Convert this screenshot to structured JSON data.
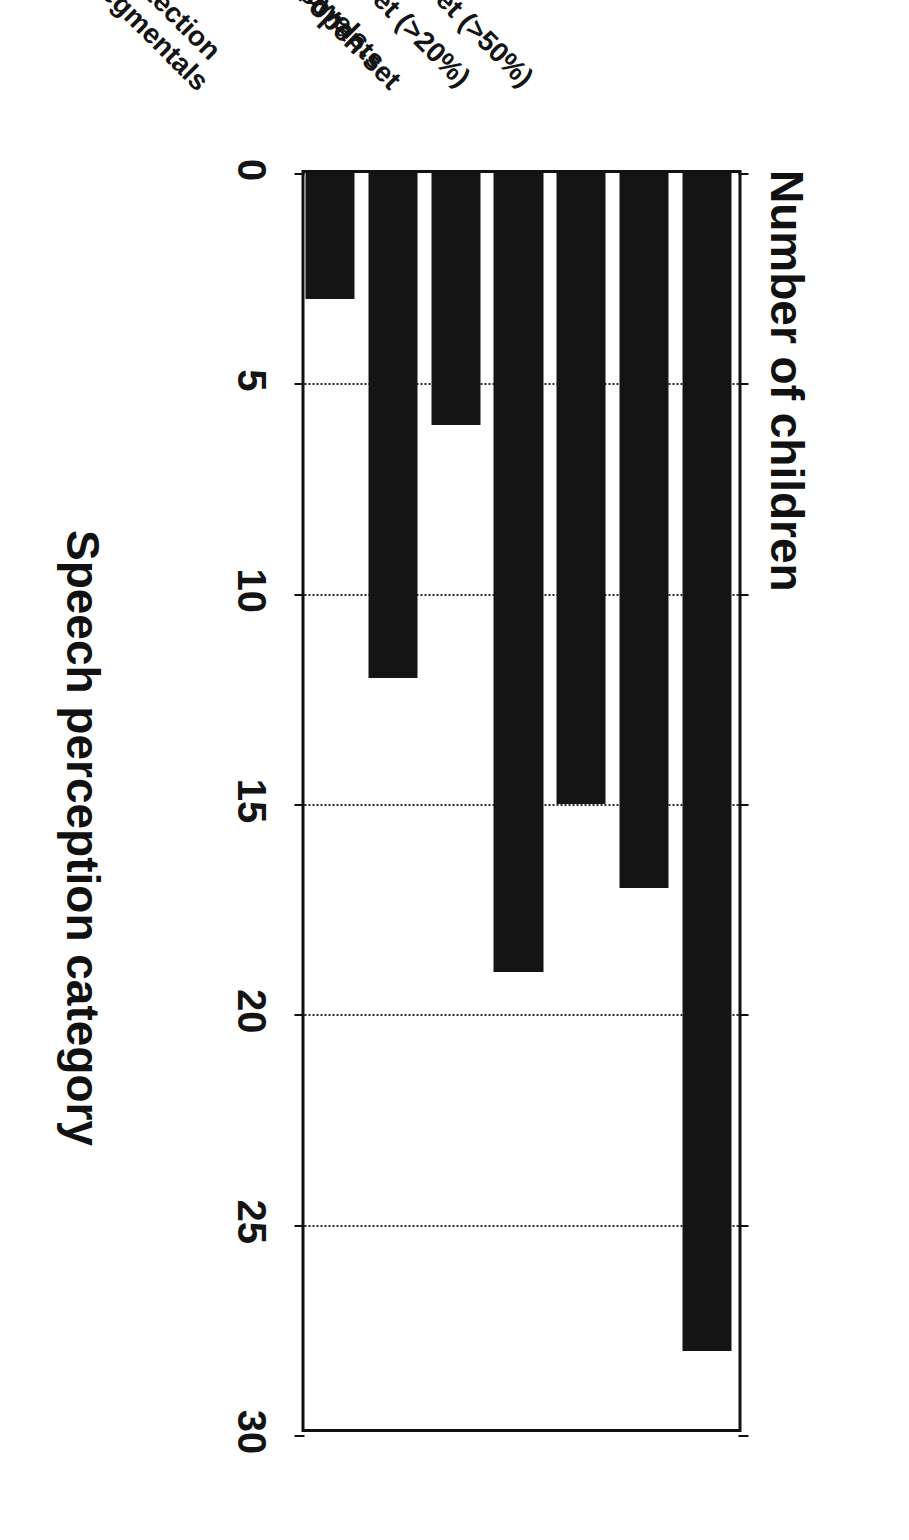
{
  "figure": {
    "orientation": "page-rotated-90-clockwise",
    "background_color": "#ffffff",
    "bar_color": "#141414",
    "axis_color": "#111111",
    "gridline_color": "#2b2b2b"
  },
  "chart_data": {
    "type": "bar",
    "title": "",
    "orientation": "vertical",
    "xlabel": "Speech perception category",
    "ylabel": "Number of children",
    "categories": [
      "1. Detection",
      "2. Suprasegmentals",
      "3. Vowels",
      "4. Consonants",
      "5. Minimal open-set",
      "6. Open-set (>20%)",
      "7. Open-set (>50%)"
    ],
    "values": [
      3,
      12,
      6,
      19,
      15,
      17,
      28
    ],
    "ylim": [
      0,
      30
    ],
    "yticks": [
      0,
      5,
      10,
      15,
      20,
      25,
      30
    ],
    "ytick_labels": [
      "0",
      "5",
      "10",
      "15",
      "20",
      "25",
      "30"
    ],
    "grid": true,
    "grid_style": "dotted",
    "grid_axis": "y",
    "legend": false
  }
}
